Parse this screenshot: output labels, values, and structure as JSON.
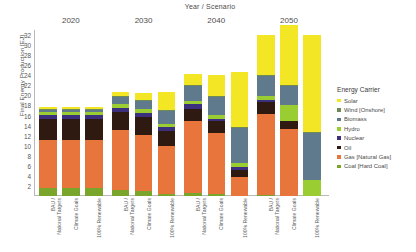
{
  "chart_data": {
    "type": "bar",
    "title": "Year / Scenario",
    "xlabel": "Year / Scenario",
    "ylabel": "Final Energy Production [EJ]",
    "ylim": [
      0,
      33
    ],
    "yticks": [
      2,
      4,
      6,
      8,
      10,
      12,
      14,
      16,
      18,
      20,
      22,
      24,
      26,
      28,
      30,
      32
    ],
    "grid": false,
    "stacked": true,
    "legend_position": "right",
    "legend_title": "Energy Carrier",
    "groups": [
      "2020",
      "2030",
      "2040",
      "2050"
    ],
    "categories": [
      "BAU / National Targets",
      "Climate Goals",
      "100% Renewable",
      "BAU / National Targets",
      "Climate Goals",
      "100% Renewable",
      "BAU / National Targets",
      "Climate Goals",
      "100% Renewable",
      "BAU / National Targets",
      "Climate Goals",
      "100% Renewable"
    ],
    "series": [
      {
        "name": "Coal [Hard Coal]",
        "color": "#7AA52B",
        "values": [
          1.5,
          1.5,
          1.5,
          1.1,
          0.9,
          0.5,
          0.6,
          0.4,
          0.0,
          0.3,
          0.0,
          0.0
        ]
      },
      {
        "name": "Gas [Natural Gas]",
        "color": "#E8763C",
        "values": [
          9.6,
          9.6,
          9.6,
          12.0,
          11.3,
          9.4,
          14.4,
          12.2,
          3.8,
          16.1,
          13.4,
          0.0
        ]
      },
      {
        "name": "Oil",
        "color": "#2E1A10",
        "values": [
          4.3,
          4.3,
          4.3,
          3.6,
          3.6,
          3.0,
          2.4,
          2.3,
          1.4,
          2.2,
          1.5,
          0.0
        ]
      },
      {
        "name": "Nuclear",
        "color": "#3B2F7E",
        "values": [
          0.8,
          0.8,
          0.8,
          0.8,
          0.8,
          0.8,
          0.8,
          0.4,
          0.6,
          0.4,
          0.0,
          0.0
        ]
      },
      {
        "name": "Hydro",
        "color": "#9ACD32",
        "values": [
          0.6,
          0.6,
          0.6,
          0.7,
          0.7,
          0.7,
          0.7,
          0.8,
          0.8,
          0.8,
          3.1,
          3.2
        ]
      },
      {
        "name": "Biomass",
        "color": "#5F7A8C",
        "values": [
          0.4,
          0.4,
          0.4,
          1.4,
          1.6,
          2.6,
          3.0,
          3.5,
          7.0,
          4.0,
          3.8,
          9.4
        ]
      },
      {
        "name": "Wind [Onshore]",
        "color": "#6E8A57",
        "values": [
          0.2,
          0.2,
          0.2,
          0.2,
          0.2,
          0.2,
          0.2,
          0.2,
          0.2,
          0.2,
          0.2,
          0.2
        ]
      },
      {
        "name": "Solar",
        "color": "#F2E625",
        "values": [
          0.4,
          0.4,
          0.4,
          0.8,
          1.3,
          3.4,
          2.2,
          4.3,
          10.8,
          8.1,
          12.1,
          19.3
        ]
      }
    ],
    "totals": [
      17.8,
      17.8,
      17.8,
      20.6,
      20.4,
      20.6,
      24.3,
      24.1,
      24.6,
      32.1,
      34.1,
      32.1
    ]
  },
  "legend": {
    "title": "Energy Carrier",
    "items": [
      {
        "label": "Solar",
        "color": "#F2E625"
      },
      {
        "label": "Wind [Onshore]",
        "color": "#6E8A57"
      },
      {
        "label": "Biomass",
        "color": "#5F7A8C"
      },
      {
        "label": "Hydro",
        "color": "#9ACD32"
      },
      {
        "label": "Nuclear",
        "color": "#3B2F7E"
      },
      {
        "label": "Oil",
        "color": "#2E1A10"
      },
      {
        "label": "Gas [Natural Gas]",
        "color": "#E8763C"
      },
      {
        "label": "Coal [Hard Coal]",
        "color": "#7AA52B"
      }
    ]
  }
}
